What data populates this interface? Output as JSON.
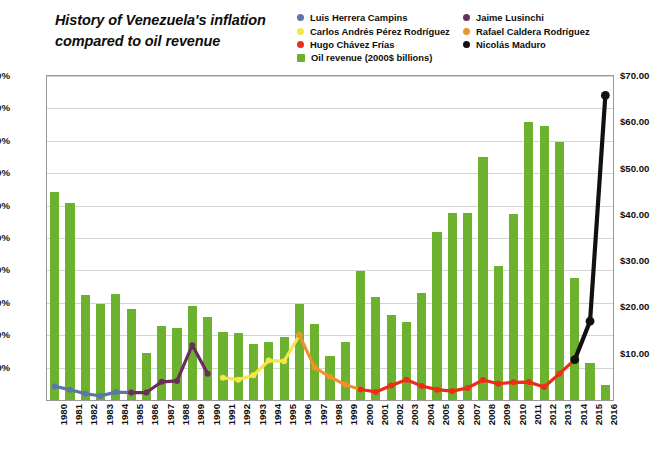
{
  "title": {
    "line1": "History of Venezuela's inflation",
    "line2": "compared to oil revenue",
    "full": "History of Venezuela's inflation compared to oil revenue"
  },
  "legend": {
    "position": "top-right",
    "entries": [
      {
        "label": "Luis Herrera Campins",
        "color": "#5B76A8",
        "marker": "circle"
      },
      {
        "label": "Jaime Lusinchi",
        "color": "#6B2C5E",
        "marker": "circle"
      },
      {
        "label": "Carlos Andrés Pérez Rodríguez",
        "color": "#F2E64B",
        "marker": "circle"
      },
      {
        "label": "Rafael Caldera Rodríguez",
        "color": "#F0922B",
        "marker": "circle"
      },
      {
        "label": "Hugo Chávez Frías",
        "color": "#EE2D18",
        "marker": "circle"
      },
      {
        "label": "Nicolás Maduro",
        "color": "#111111",
        "marker": "circle"
      },
      {
        "label": "Oil revenue (2000$ billions)",
        "color": "#6CB22E",
        "marker": "square"
      }
    ]
  },
  "axes": {
    "left": {
      "label": "",
      "ticks": [
        "50%",
        "100%",
        "150%",
        "200%",
        "250%",
        "300%",
        "350%",
        "400%",
        "450%",
        "500%"
      ],
      "min": 0,
      "max": 500,
      "step": 50,
      "unit": "%"
    },
    "right": {
      "label": "",
      "ticks": [
        "$10.00",
        "$20.00",
        "$30.00",
        "$40.00",
        "$50.00",
        "$60.00",
        "$70.00"
      ],
      "min": 0,
      "max": 70,
      "step": 10,
      "unit": "$"
    },
    "x": {
      "ticks": [
        "1980",
        "1981",
        "1982",
        "1983",
        "1984",
        "1985",
        "1986",
        "1987",
        "1988",
        "1989",
        "1990",
        "1991",
        "1992",
        "1993",
        "1994",
        "1995",
        "1996",
        "1997",
        "1998",
        "1999",
        "2000",
        "2001",
        "2002",
        "2003",
        "2004",
        "2005",
        "2006",
        "2007",
        "2008",
        "2009",
        "2010",
        "2011",
        "2012",
        "2013",
        "2014",
        "2015",
        "2016"
      ]
    },
    "grid": true
  },
  "chart_data": {
    "type": "bar",
    "title": "History of Venezuela's inflation compared to oil revenue",
    "xlabel": "",
    "ylabel": "",
    "ylim": [
      0,
      500
    ],
    "y2lim": [
      0,
      70
    ],
    "grid": true,
    "legend_position": "top-right",
    "categories": [
      "1980",
      "1981",
      "1982",
      "1983",
      "1984",
      "1985",
      "1986",
      "1987",
      "1988",
      "1989",
      "1990",
      "1991",
      "1992",
      "1993",
      "1994",
      "1995",
      "1996",
      "1997",
      "1998",
      "1999",
      "2000",
      "2001",
      "2002",
      "2003",
      "2004",
      "2005",
      "2006",
      "2007",
      "2008",
      "2009",
      "2010",
      "2011",
      "2012",
      "2013",
      "2014",
      "2015",
      "2016"
    ],
    "series": [
      {
        "name": "Oil revenue (2000$ billions)",
        "type": "bar",
        "axis": "right",
        "color": "#6CB22E",
        "unit": "$ billions",
        "values": [
          45.0,
          42.5,
          22.7,
          20.8,
          23.0,
          19.6,
          10.2,
          16.0,
          15.5,
          20.3,
          17.9,
          14.7,
          14.5,
          12.2,
          12.6,
          13.6,
          20.7,
          16.5,
          9.5,
          12.6,
          27.8,
          22.2,
          18.3,
          16.8,
          23.1,
          36.4,
          40.3,
          40.3,
          52.4,
          28.9,
          40.2,
          60.0,
          59.3,
          55.7,
          26.4,
          8.0,
          3.2
        ]
      },
      {
        "name": "Luis Herrera Campins",
        "type": "line",
        "axis": "left",
        "color": "#5B76A8",
        "unit": "%",
        "x": [
          "1980",
          "1981",
          "1982",
          "1983",
          "1984",
          "1985"
        ],
        "values": [
          21.0,
          16.0,
          9.6,
          6.3,
          12.2,
          11.4
        ]
      },
      {
        "name": "Jaime Lusinchi",
        "type": "line",
        "axis": "left",
        "color": "#6B2C5E",
        "unit": "%",
        "x": [
          "1985",
          "1986",
          "1987",
          "1988",
          "1989",
          "1990"
        ],
        "values": [
          11.4,
          11.5,
          28.1,
          29.5,
          84.5,
          40.7
        ]
      },
      {
        "name": "Carlos Andrés Pérez Rodríguez",
        "type": "line",
        "axis": "left",
        "color": "#F2E64B",
        "unit": "%",
        "x": [
          "1991",
          "1992",
          "1993",
          "1994",
          "1995",
          "1996"
        ],
        "values": [
          34.2,
          31.4,
          38.1,
          60.8,
          59.9,
          99.9
        ]
      },
      {
        "name": "Rafael Caldera Rodríguez",
        "type": "line",
        "axis": "left",
        "color": "#F0922B",
        "unit": "%",
        "x": [
          "1996",
          "1997",
          "1998",
          "1999",
          "2000"
        ],
        "values": [
          99.9,
          50.0,
          35.8,
          23.6,
          16.2
        ]
      },
      {
        "name": "Hugo Chávez Frías",
        "type": "line",
        "axis": "left",
        "color": "#EE2D18",
        "unit": "%",
        "x": [
          "2000",
          "2001",
          "2002",
          "2003",
          "2004",
          "2005",
          "2006",
          "2007",
          "2008",
          "2009",
          "2010",
          "2011",
          "2012",
          "2013",
          "2014"
        ],
        "values": [
          16.2,
          12.5,
          22.4,
          31.1,
          21.7,
          16.0,
          13.7,
          18.7,
          30.9,
          25.1,
          27.2,
          27.6,
          20.1,
          40.6,
          62.2
        ]
      },
      {
        "name": "Nicolás Maduro",
        "type": "line",
        "axis": "left",
        "color": "#111111",
        "unit": "%",
        "x": [
          "2014",
          "2015",
          "2016"
        ],
        "values": [
          62.2,
          121.7,
          470.0
        ]
      }
    ]
  }
}
